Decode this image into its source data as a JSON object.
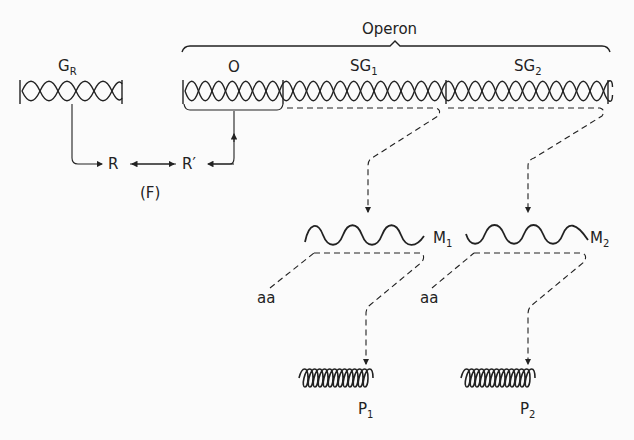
{
  "diagram": {
    "operon_label": "Operon",
    "regulator_gene": {
      "label": "G",
      "sub": "R"
    },
    "operator": {
      "label": "O"
    },
    "structural_genes": [
      {
        "label": "SG",
        "sub": "1"
      },
      {
        "label": "SG",
        "sub": "2"
      }
    ],
    "repressor": {
      "label": "R"
    },
    "repressor_complex": {
      "label": "R′"
    },
    "figure_tag": "(F)",
    "mrnas": [
      {
        "label": "M",
        "sub": "1"
      },
      {
        "label": "M",
        "sub": "2"
      }
    ],
    "amino_acids": [
      {
        "label": "aa"
      },
      {
        "label": "aa"
      }
    ],
    "proteins": [
      {
        "label": "P",
        "sub": "1"
      },
      {
        "label": "P",
        "sub": "2"
      }
    ],
    "colors": {
      "ink": "#222222",
      "background": "#fbfbfb"
    }
  }
}
